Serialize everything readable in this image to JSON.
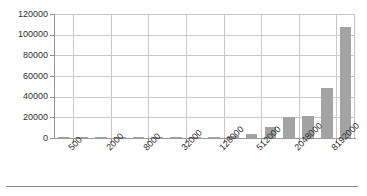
{
  "chart_data": {
    "type": "bar",
    "title": "",
    "subtitle": "",
    "xlabel": "",
    "ylabel": "",
    "grid": true,
    "legend": false,
    "legend_position": "none",
    "bar_color": "#a3a3a3",
    "axis_color": "#9a9a9a",
    "grid_color": "#c9c9c9",
    "text_color": "#2f2f2f",
    "ylim": [
      0,
      120000
    ],
    "ytick_labels": [
      "0",
      "20000",
      "40000",
      "60000",
      "80000",
      "100000",
      "120000"
    ],
    "ytick_values": [
      0,
      20000,
      40000,
      60000,
      80000,
      100000,
      120000
    ],
    "xtick_labels": [
      "500",
      "2000",
      "8000",
      "32000",
      "128000",
      "512000",
      "2048000",
      "8192000"
    ],
    "categories": [
      "500",
      "1000",
      "2000",
      "4000",
      "8000",
      "16000",
      "32000",
      "64000",
      "128000",
      "256000",
      "512000",
      "1024000",
      "2048000",
      "4096000",
      "8192000",
      "16384000"
    ],
    "values": [
      40,
      70,
      130,
      260,
      330,
      450,
      900,
      950,
      1100,
      1700,
      4300,
      10200,
      20700,
      21000,
      48400,
      107000
    ],
    "bar_count": 16,
    "labeled_every_n": 2,
    "max_value": 107000,
    "x_label_rotation": -45
  }
}
